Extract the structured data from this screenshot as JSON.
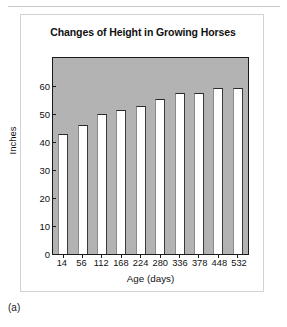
{
  "figure": {
    "caption": "(a)"
  },
  "chart_data": {
    "type": "bar",
    "title": "Changes of Height in Growing Horses",
    "xlabel": "Age (days)",
    "ylabel": "Inches",
    "categories": [
      "14",
      "56",
      "112",
      "168",
      "224",
      "280",
      "336",
      "378",
      "448",
      "532"
    ],
    "values": [
      43,
      46,
      50,
      51.5,
      53,
      55.5,
      57.5,
      57.5,
      59.5,
      59.5
    ],
    "ylim": [
      0,
      70
    ],
    "yticks": [
      "0",
      "10",
      "20",
      "30",
      "40",
      "50",
      "60"
    ],
    "ytick_values": [
      0,
      10,
      20,
      30,
      40,
      50,
      60
    ],
    "grid": false,
    "legend": false,
    "plot_background_color": "#b3b3b3",
    "bar_fill_color": "#ffffff",
    "bar_edge_color": "#2b2b2b",
    "axis_color": "#1a1a1a"
  }
}
